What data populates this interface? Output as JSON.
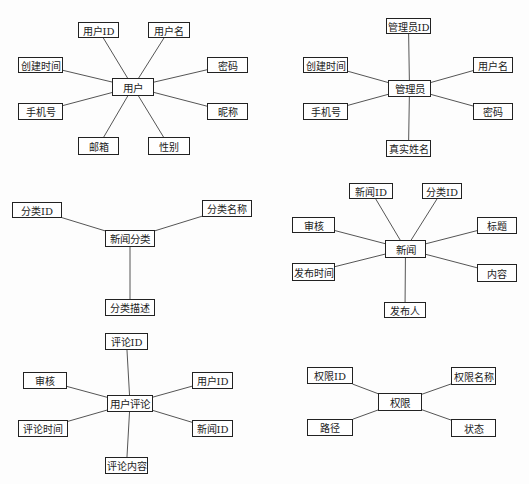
{
  "diagram": {
    "type": "er-attribute-diagram",
    "line_color": "#555555",
    "border_color": "#222222",
    "entities": [
      {
        "id": "user",
        "name": "用户",
        "box": [
          112,
          78,
          42,
          18
        ],
        "attributes": [
          {
            "label": "用户ID",
            "box": [
              78,
              22,
              41,
              16
            ]
          },
          {
            "label": "用户名",
            "box": [
              148,
              22,
              42,
              16
            ]
          },
          {
            "label": "创建时间",
            "box": [
              18,
              57,
              45,
              16
            ]
          },
          {
            "label": "密码",
            "box": [
              207,
              57,
              41,
              16
            ]
          },
          {
            "label": "手机号",
            "box": [
              18,
              103,
              45,
              17
            ]
          },
          {
            "label": "昵称",
            "box": [
              207,
              103,
              41,
              17
            ]
          },
          {
            "label": "邮箱",
            "box": [
              78,
              137,
              41,
              18
            ]
          },
          {
            "label": "性别",
            "box": [
              148,
              137,
              42,
              18
            ]
          }
        ]
      },
      {
        "id": "admin",
        "name": "管理员",
        "box": [
          388,
          80,
          43,
          17
        ],
        "attributes": [
          {
            "label": "管理员ID",
            "box": [
              386,
              18,
              45,
              16
            ]
          },
          {
            "label": "创建时间",
            "box": [
              303,
              57,
              45,
              16
            ]
          },
          {
            "label": "用户名",
            "box": [
              473,
              57,
              40,
              16
            ]
          },
          {
            "label": "手机号",
            "box": [
              303,
              103,
              45,
              17
            ]
          },
          {
            "label": "密码",
            "box": [
              473,
              103,
              40,
              17
            ]
          },
          {
            "label": "真实姓名",
            "box": [
              386,
              140,
              45,
              17
            ]
          }
        ]
      },
      {
        "id": "news_category",
        "name": "新闻分类",
        "box": [
          105,
          230,
          50,
          17
        ],
        "attributes": [
          {
            "label": "分类ID",
            "box": [
              12,
              202,
              50,
              16
            ]
          },
          {
            "label": "分类名称",
            "box": [
              202,
              200,
              50,
              17
            ]
          },
          {
            "label": "分类描述",
            "box": [
              105,
              299,
              50,
              17
            ]
          }
        ]
      },
      {
        "id": "news",
        "name": "新闻",
        "box": [
          385,
          240,
          41,
          18
        ],
        "attributes": [
          {
            "label": "新闻ID",
            "box": [
              349,
              183,
              44,
              16
            ]
          },
          {
            "label": "分类ID",
            "box": [
              422,
              183,
              40,
              16
            ]
          },
          {
            "label": "审核",
            "box": [
              292,
              217,
              43,
              16
            ]
          },
          {
            "label": "标题",
            "box": [
              477,
              217,
              40,
              17
            ]
          },
          {
            "label": "发布时间",
            "box": [
              292,
              263,
              43,
              18
            ]
          },
          {
            "label": "内容",
            "box": [
              477,
              264,
              40,
              18
            ]
          },
          {
            "label": "发布人",
            "box": [
              384,
              302,
              42,
              16
            ]
          }
        ]
      },
      {
        "id": "user_comment",
        "name": "用户评论",
        "box": [
          107,
          395,
          46,
          17
        ],
        "attributes": [
          {
            "label": "评论ID",
            "box": [
              105,
              333,
              43,
              17
            ]
          },
          {
            "label": "审核",
            "box": [
              23,
              372,
              44,
              17
            ]
          },
          {
            "label": "用户ID",
            "box": [
              192,
              372,
              41,
              17
            ]
          },
          {
            "label": "评论时间",
            "box": [
              18,
              420,
              50,
              17
            ]
          },
          {
            "label": "新闻ID",
            "box": [
              192,
              420,
              41,
              17
            ]
          },
          {
            "label": "评论内容",
            "box": [
              105,
              457,
              43,
              17
            ]
          }
        ]
      },
      {
        "id": "permission",
        "name": "权限",
        "box": [
          378,
          393,
          44,
          18
        ],
        "attributes": [
          {
            "label": "权限ID",
            "box": [
              307,
              367,
              46,
              17
            ]
          },
          {
            "label": "权限名称",
            "box": [
              451,
              367,
              45,
              18
            ]
          },
          {
            "label": "路径",
            "box": [
              307,
              419,
              46,
              17
            ]
          },
          {
            "label": "状态",
            "box": [
              451,
              419,
              45,
              18
            ]
          }
        ]
      }
    ]
  }
}
